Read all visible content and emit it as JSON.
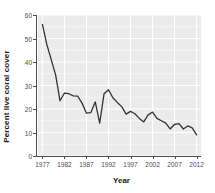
{
  "chart_data": {
    "type": "line",
    "title": "",
    "subtitle": "",
    "xlabel": "Year",
    "ylabel": "Percent live coral cover",
    "xlim": [
      1976,
      2013
    ],
    "ylim": [
      0,
      60
    ],
    "xticks": [
      1977,
      1982,
      1987,
      1992,
      1997,
      2002,
      2007,
      2012
    ],
    "yticks": [
      0,
      10,
      20,
      30,
      40,
      50,
      60
    ],
    "grid": true,
    "grid_color": "#ffffff",
    "panel_color": "#ebebeb",
    "line_color": "#333333",
    "legend": "none",
    "series": [
      {
        "name": "Percent live coral cover",
        "x": [
          1977,
          1978,
          1979,
          1980,
          1981,
          1982,
          1983,
          1984,
          1985,
          1986,
          1987,
          1988,
          1989,
          1990,
          1991,
          1992,
          1993,
          1994,
          1995,
          1996,
          1997,
          1998,
          1999,
          2000,
          2001,
          2002,
          2003,
          2004,
          2005,
          2006,
          2007,
          2008,
          2009,
          2010,
          2011,
          2012
        ],
        "values": [
          56.0,
          47.5,
          41.0,
          34.5,
          23.5,
          26.8,
          26.5,
          25.6,
          25.5,
          22.5,
          18.2,
          18.5,
          23.0,
          14.0,
          26.5,
          28.2,
          24.8,
          22.8,
          21.0,
          17.8,
          19.0,
          18.0,
          16.0,
          14.5,
          17.5,
          18.7,
          16.0,
          15.0,
          14.0,
          11.5,
          13.5,
          13.8,
          11.5,
          12.8,
          12.0,
          9.0
        ]
      }
    ]
  }
}
